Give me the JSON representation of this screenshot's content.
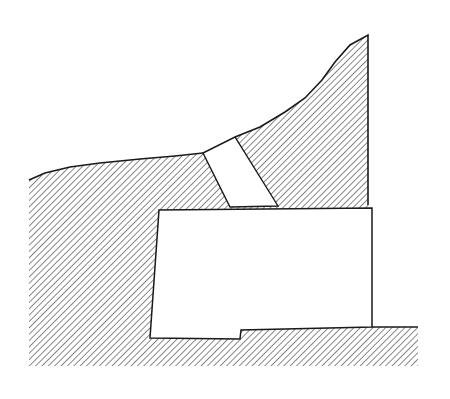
{
  "figure": {
    "type": "cross-section-drawing",
    "colors": {
      "background": "#ffffff",
      "ink": "#1a1a1a",
      "hatch": "#2a2a2a"
    },
    "elements": [
      "ground-mass",
      "inclined-shaft",
      "rectangular-chamber",
      "floor-step"
    ]
  }
}
